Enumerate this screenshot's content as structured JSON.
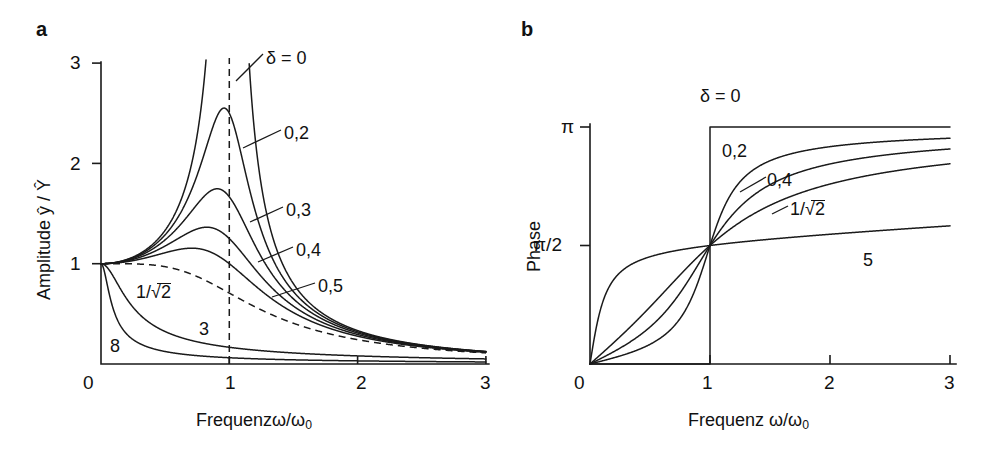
{
  "figure": {
    "panels": [
      {
        "letter": "a",
        "xlabel": "Frequenzω/ω",
        "xlabel_sub": "0",
        "ylabel": "Amplitude ŷ / Ŷ",
        "xticks": [
          "0",
          "1",
          "2",
          "3"
        ],
        "yticks": [
          "1",
          "2",
          "3"
        ],
        "curve_labels": [
          "δ = 0",
          "0,2",
          "0,3",
          "0,4",
          "0,5",
          "1/",
          "2",
          "3",
          "8"
        ]
      },
      {
        "letter": "b",
        "xlabel": "Frequenz ω/ω",
        "xlabel_sub": "0",
        "ylabel": "Phase",
        "xticks": [
          "0",
          "1",
          "2",
          "3"
        ],
        "yticks": [
          "π/2",
          "π"
        ],
        "curve_labels": [
          "δ = 0",
          "0,2",
          "0,4",
          "1/",
          "2",
          "5"
        ]
      }
    ]
  },
  "chart_data": [
    {
      "type": "line",
      "panel": "a",
      "title": "",
      "xlabel": "Frequenz ω/ω₀",
      "ylabel": "Amplitude ŷ / Ŷ",
      "xlim": [
        0,
        3
      ],
      "ylim": [
        0,
        3
      ],
      "xticks": [
        0,
        1,
        2,
        3
      ],
      "yticks": [
        1,
        2,
        3
      ],
      "grid": false,
      "legend": "inline-curve-labels",
      "formula": "yhat/Yhat = 1 / sqrt((1-eta^2)^2 + (2*delta*eta)^2)",
      "annotations": [
        {
          "text": "δ = 0",
          "damping": 0.0,
          "style": "solid"
        },
        {
          "text": "0,2",
          "damping": 0.2,
          "style": "solid"
        },
        {
          "text": "0,3",
          "damping": 0.3,
          "style": "solid"
        },
        {
          "text": "0,4",
          "damping": 0.4,
          "style": "solid"
        },
        {
          "text": "0,5",
          "damping": 0.5,
          "style": "solid"
        },
        {
          "text": "1/√2",
          "damping": 0.7071,
          "style": "dashed"
        },
        {
          "text": "3",
          "damping": 3.0,
          "style": "solid"
        },
        {
          "text": "8",
          "damping": 8.0,
          "style": "solid"
        }
      ],
      "reference_line": {
        "x": 1,
        "style": "dashed",
        "orientation": "vertical"
      },
      "series": [
        {
          "name": "δ = 0",
          "damping": 0.0,
          "x": [
            0,
            0.2,
            0.4,
            0.6,
            0.7,
            0.8,
            0.85,
            0.9,
            0.95,
            1.05,
            1.1,
            1.2,
            1.4,
            1.6,
            2.0,
            2.5,
            3.0
          ],
          "y": [
            1.0,
            1.042,
            1.19,
            1.563,
            1.961,
            2.778,
            3.604,
            5.263,
            10.26,
            9.756,
            4.762,
            2.273,
            1.042,
            0.641,
            0.333,
            0.19,
            0.125
          ]
        },
        {
          "name": "0,2",
          "damping": 0.2,
          "x": [
            0,
            0.2,
            0.4,
            0.6,
            0.8,
            0.9,
            0.96,
            1.0,
            1.1,
            1.2,
            1.4,
            1.6,
            2.0,
            2.5,
            3.0
          ],
          "y": [
            1.0,
            1.038,
            1.17,
            1.485,
            2.046,
            2.417,
            2.55,
            2.5,
            1.972,
            1.441,
            0.891,
            0.594,
            0.324,
            0.188,
            0.124
          ]
        },
        {
          "name": "0,3",
          "damping": 0.3,
          "x": [
            0,
            0.2,
            0.4,
            0.6,
            0.8,
            0.9,
            0.91,
            1.0,
            1.1,
            1.2,
            1.4,
            1.6,
            2.0,
            2.5,
            3.0
          ],
          "y": [
            1.0,
            1.032,
            1.134,
            1.369,
            1.713,
            1.747,
            1.748,
            1.667,
            1.468,
            1.192,
            0.812,
            0.566,
            0.318,
            0.186,
            0.123
          ]
        },
        {
          "name": "0,4",
          "damping": 0.4,
          "x": [
            0,
            0.2,
            0.4,
            0.6,
            0.8,
            0.82,
            0.9,
            1.0,
            1.1,
            1.2,
            1.4,
            1.6,
            2.0,
            2.5,
            3.0
          ],
          "y": [
            1.0,
            1.024,
            1.087,
            1.236,
            1.374,
            1.376,
            1.338,
            1.25,
            1.124,
            0.968,
            0.713,
            0.526,
            0.309,
            0.183,
            0.122
          ]
        },
        {
          "name": "0,5",
          "damping": 0.5,
          "x": [
            0,
            0.2,
            0.4,
            0.6,
            0.7,
            0.8,
            0.9,
            1.0,
            1.1,
            1.2,
            1.4,
            1.6,
            2.0,
            2.5,
            3.0
          ],
          "y": [
            1.0,
            1.015,
            1.038,
            1.094,
            1.12,
            1.131,
            1.106,
            1.0,
            0.923,
            0.822,
            0.636,
            0.485,
            0.298,
            0.179,
            0.121
          ]
        },
        {
          "name": "1/√2",
          "damping": 0.7071,
          "style": "dashed",
          "x": [
            0,
            0.2,
            0.4,
            0.6,
            0.8,
            1.0,
            1.2,
            1.4,
            1.6,
            2.0,
            2.5,
            3.0
          ],
          "y": [
            1.0,
            0.999,
            0.992,
            0.974,
            0.931,
            0.707,
            0.591,
            0.483,
            0.402,
            0.277,
            0.173,
            0.119
          ]
        },
        {
          "name": "3",
          "damping": 3.0,
          "x": [
            0,
            0.1,
            0.2,
            0.3,
            0.5,
            0.8,
            1.0,
            1.5,
            2.0,
            2.5,
            3.0
          ],
          "y": [
            1.0,
            0.861,
            0.637,
            0.477,
            0.308,
            0.201,
            0.167,
            0.108,
            0.08,
            0.064,
            0.053
          ]
        },
        {
          "name": "8",
          "damping": 8.0,
          "x": [
            0,
            0.05,
            0.1,
            0.2,
            0.3,
            0.5,
            1.0,
            1.5,
            2.0,
            2.5,
            3.0
          ],
          "y": [
            1.0,
            0.928,
            0.782,
            0.528,
            0.382,
            0.244,
            0.0625,
            0.041,
            0.031,
            0.025,
            0.021
          ]
        }
      ]
    },
    {
      "type": "line",
      "panel": "b",
      "title": "",
      "xlabel": "Frequenz ω/ω₀",
      "ylabel": "Phase",
      "xlim": [
        0,
        3
      ],
      "ylim": [
        0,
        3.1416
      ],
      "xticks": [
        0,
        1,
        2,
        3
      ],
      "yticks": [
        1.5708,
        3.1416
      ],
      "ytick_labels": [
        "π/2",
        "π"
      ],
      "grid": false,
      "legend": "inline-curve-labels",
      "formula": "phase = atan2(2*delta*eta, 1-eta^2)",
      "annotations": [
        {
          "text": "δ = 0",
          "damping": 0.0
        },
        {
          "text": "0,2",
          "damping": 0.2
        },
        {
          "text": "0,4",
          "damping": 0.4
        },
        {
          "text": "1/√2",
          "damping": 0.7071
        },
        {
          "text": "5",
          "damping": 5.0
        }
      ],
      "series": [
        {
          "name": "δ = 0",
          "damping": 0.0,
          "x": [
            0,
            0.999,
            1.0,
            1.001,
            2.0,
            3.0
          ],
          "y": [
            0,
            0,
            1.5708,
            3.1416,
            3.1416,
            3.1416
          ]
        },
        {
          "name": "0,2",
          "damping": 0.2,
          "x": [
            0,
            0.2,
            0.4,
            0.6,
            0.8,
            0.9,
            1.0,
            1.2,
            1.4,
            1.6,
            2.0,
            2.5,
            3.0
          ],
          "y": [
            0,
            0.083,
            0.19,
            0.355,
            0.67,
            1.007,
            1.571,
            2.498,
            2.761,
            2.866,
            2.968,
            3.028,
            3.054
          ]
        },
        {
          "name": "0,4",
          "damping": 0.4,
          "x": [
            0,
            0.2,
            0.4,
            0.6,
            0.8,
            0.9,
            1.0,
            1.2,
            1.4,
            1.6,
            2.0,
            2.5,
            3.0
          ],
          "y": [
            0,
            0.166,
            0.375,
            0.659,
            1.051,
            1.281,
            1.571,
            2.19,
            2.502,
            2.688,
            2.884,
            2.996,
            3.045
          ]
        },
        {
          "name": "1/√2",
          "damping": 0.7071,
          "x": [
            0,
            0.2,
            0.4,
            0.6,
            0.8,
            0.9,
            1.0,
            1.2,
            1.4,
            1.6,
            2.0,
            2.5,
            3.0
          ],
          "y": [
            0,
            0.29,
            0.626,
            1.015,
            1.315,
            1.444,
            1.571,
            1.876,
            2.179,
            2.406,
            2.696,
            2.87,
            2.954
          ]
        },
        {
          "name": "5",
          "damping": 5.0,
          "x": [
            0,
            0.2,
            0.4,
            0.6,
            0.8,
            1.0,
            1.4,
            1.8,
            2.2,
            2.6,
            3.0
          ],
          "y": [
            0,
            1.12,
            1.388,
            1.478,
            1.534,
            1.571,
            1.637,
            1.704,
            1.773,
            1.84,
            1.901
          ]
        }
      ]
    }
  ]
}
